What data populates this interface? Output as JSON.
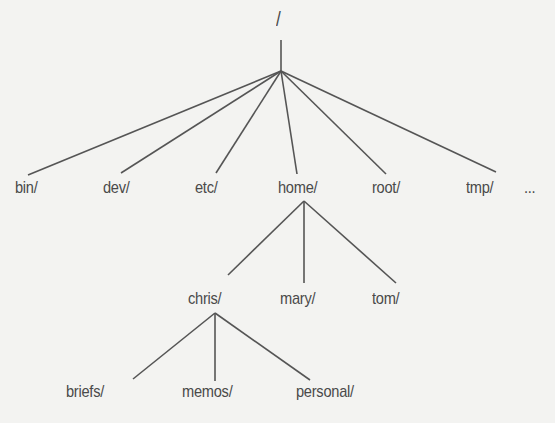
{
  "root": {
    "label": "/",
    "x": 276,
    "y": 9
  },
  "level1": [
    {
      "label": "bin/",
      "x": 15,
      "y": 178
    },
    {
      "label": "dev/",
      "x": 103,
      "y": 178
    },
    {
      "label": "etc/",
      "x": 195,
      "y": 178
    },
    {
      "label": "home/",
      "x": 278,
      "y": 178
    },
    {
      "label": "root/",
      "x": 372,
      "y": 178
    },
    {
      "label": "tmp/",
      "x": 466,
      "y": 178
    },
    {
      "label": "...",
      "x": 524,
      "y": 178
    }
  ],
  "home_children": [
    {
      "label": "chris/",
      "x": 188,
      "y": 289
    },
    {
      "label": "mary/",
      "x": 280,
      "y": 289
    },
    {
      "label": "tom/",
      "x": 372,
      "y": 289
    }
  ],
  "chris_children": [
    {
      "label": "briefs/",
      "x": 66,
      "y": 382
    },
    {
      "label": "memos/",
      "x": 182,
      "y": 382
    },
    {
      "label": "personal/",
      "x": 296,
      "y": 382
    }
  ],
  "edges": [
    [
      281,
      40,
      281,
      71
    ],
    [
      281,
      71,
      28,
      175
    ],
    [
      281,
      71,
      121,
      173
    ],
    [
      281,
      71,
      216,
      173
    ],
    [
      281,
      71,
      297,
      174
    ],
    [
      281,
      71,
      386,
      174
    ],
    [
      281,
      71,
      496,
      172
    ],
    [
      304,
      201,
      228,
      275
    ],
    [
      304,
      201,
      304,
      283
    ],
    [
      304,
      201,
      396,
      283
    ],
    [
      215,
      313,
      133,
      379
    ],
    [
      215,
      313,
      215,
      381
    ],
    [
      215,
      313,
      310,
      380
    ]
  ]
}
